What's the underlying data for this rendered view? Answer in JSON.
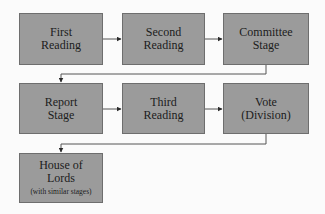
{
  "diagram": {
    "type": "flowchart",
    "colors": {
      "background": "#fbfbfb",
      "box_fill": "#9b9b9b",
      "box_border": "#6e6e6e",
      "text": "#1c1c1c",
      "connector": "#555555"
    },
    "nodes": [
      {
        "id": "first-reading",
        "line1": "First",
        "line2": "Reading",
        "note": ""
      },
      {
        "id": "second-reading",
        "line1": "Second",
        "line2": "Reading",
        "note": ""
      },
      {
        "id": "committee-stage",
        "line1": "Committee",
        "line2": "Stage",
        "note": ""
      },
      {
        "id": "report-stage",
        "line1": "Report",
        "line2": "Stage",
        "note": ""
      },
      {
        "id": "third-reading",
        "line1": "Third",
        "line2": "Reading",
        "note": ""
      },
      {
        "id": "vote-division",
        "line1": "Vote",
        "line2": "(Division)",
        "note": ""
      },
      {
        "id": "house-of-lords",
        "line1": "House of",
        "line2": "Lords",
        "note": "(with similar stages)"
      }
    ],
    "edges": [
      {
        "from": "first-reading",
        "to": "second-reading"
      },
      {
        "from": "second-reading",
        "to": "committee-stage"
      },
      {
        "from": "committee-stage",
        "to": "report-stage"
      },
      {
        "from": "report-stage",
        "to": "third-reading"
      },
      {
        "from": "third-reading",
        "to": "vote-division"
      },
      {
        "from": "vote-division",
        "to": "house-of-lords"
      }
    ]
  }
}
